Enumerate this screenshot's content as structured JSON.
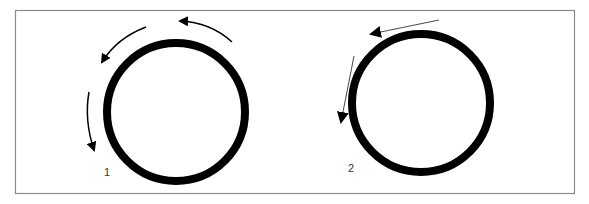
{
  "frame": {
    "border_color": "#8a8a8a"
  },
  "colors": {
    "stroke": "#000000",
    "thin_arrow": "#333333"
  },
  "panels": [
    {
      "label": "1",
      "description": "thick circle with three curved arrows tracing counter-clockwise around its upper-left perimeter",
      "circle": {
        "cx": 176,
        "cy": 112,
        "r": 69,
        "stroke_width": 8
      },
      "arrows": [
        {
          "type": "curved",
          "direction": "counter-clockwise",
          "position": "top"
        },
        {
          "type": "curved",
          "direction": "counter-clockwise",
          "position": "upper-left"
        },
        {
          "type": "curved",
          "direction": "downward",
          "position": "left"
        }
      ]
    },
    {
      "label": "2",
      "description": "thick circle with two straight tangent arrows pointing left and down",
      "circle": {
        "cx": 421,
        "cy": 103,
        "r": 69,
        "stroke_width": 8
      },
      "arrows": [
        {
          "type": "straight",
          "direction": "left",
          "position": "top"
        },
        {
          "type": "straight",
          "direction": "down",
          "position": "left"
        }
      ]
    }
  ]
}
